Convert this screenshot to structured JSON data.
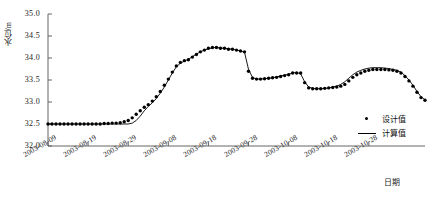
{
  "chart_data": {
    "type": "line",
    "title": "",
    "xlabel": "日期",
    "ylabel": "水位/m",
    "ylim": [
      32.0,
      35.0
    ],
    "ytick_labels": [
      "35.0",
      "34.5",
      "34.0",
      "33.5",
      "33.0",
      "32.5",
      "32.0"
    ],
    "ytick_values": [
      35.0,
      34.5,
      34.0,
      33.5,
      33.0,
      32.5,
      32.0
    ],
    "xtick_labels": [
      "2003-08-09",
      "2003-08-19",
      "2003-08-29",
      "2003-09-08",
      "2003-09-18",
      "2003-09-28",
      "2003-10-08",
      "2003-10-18",
      "2003-10-28"
    ],
    "xtick_index": [
      0,
      10,
      20,
      30,
      40,
      50,
      60,
      70,
      80
    ],
    "grid": false,
    "legend_position": "lower-right",
    "series": [
      {
        "name": "设计值",
        "marker": "dot",
        "color": "#000000",
        "values": [
          32.5,
          32.5,
          32.5,
          32.5,
          32.5,
          32.5,
          32.5,
          32.5,
          32.5,
          32.5,
          32.5,
          32.5,
          32.5,
          32.5,
          32.51,
          32.51,
          32.52,
          32.52,
          32.53,
          32.55,
          32.58,
          32.64,
          32.72,
          32.8,
          32.88,
          32.94,
          33.02,
          33.12,
          33.24,
          33.38,
          33.52,
          33.68,
          33.82,
          33.9,
          33.94,
          33.96,
          34.02,
          34.08,
          34.14,
          34.18,
          34.22,
          34.24,
          34.24,
          34.22,
          34.22,
          34.2,
          34.2,
          34.18,
          34.16,
          34.14,
          33.7,
          33.54,
          33.52,
          33.52,
          33.53,
          33.54,
          33.55,
          33.56,
          33.58,
          33.6,
          33.62,
          33.66,
          33.66,
          33.66,
          33.44,
          33.32,
          33.3,
          33.3,
          33.3,
          33.31,
          33.32,
          33.33,
          33.34,
          33.36,
          33.4,
          33.48,
          33.56,
          33.62,
          33.66,
          33.7,
          33.72,
          33.74,
          33.74,
          33.74,
          33.74,
          33.73,
          33.72,
          33.7,
          33.66,
          33.58,
          33.48,
          33.36,
          33.22,
          33.1,
          33.04
        ]
      },
      {
        "name": "计算值",
        "marker": "line",
        "color": "#000000",
        "values": [
          32.5,
          32.5,
          32.5,
          32.5,
          32.5,
          32.5,
          32.5,
          32.5,
          32.5,
          32.5,
          32.5,
          32.5,
          32.5,
          32.5,
          32.5,
          32.5,
          32.5,
          32.5,
          32.5,
          32.5,
          32.5,
          32.52,
          32.58,
          32.68,
          32.8,
          32.9,
          32.98,
          33.08,
          33.2,
          33.34,
          33.5,
          33.66,
          33.8,
          33.88,
          33.93,
          33.97,
          34.03,
          34.09,
          34.14,
          34.18,
          34.21,
          34.23,
          34.24,
          34.23,
          34.22,
          34.21,
          34.2,
          34.18,
          34.16,
          34.13,
          33.74,
          33.56,
          33.52,
          33.52,
          33.53,
          33.54,
          33.55,
          33.57,
          33.59,
          33.61,
          33.63,
          33.66,
          33.67,
          33.64,
          33.46,
          33.34,
          33.31,
          33.3,
          33.3,
          33.31,
          33.32,
          33.34,
          33.36,
          33.4,
          33.46,
          33.54,
          33.62,
          33.68,
          33.72,
          33.75,
          33.77,
          33.78,
          33.78,
          33.78,
          33.77,
          33.76,
          33.74,
          33.72,
          33.68,
          33.6,
          33.5,
          33.38,
          33.24,
          33.12,
          33.05
        ]
      }
    ]
  },
  "legend": {
    "items": [
      {
        "label": "设计值",
        "type": "dot"
      },
      {
        "label": "计算值",
        "type": "line"
      }
    ]
  }
}
